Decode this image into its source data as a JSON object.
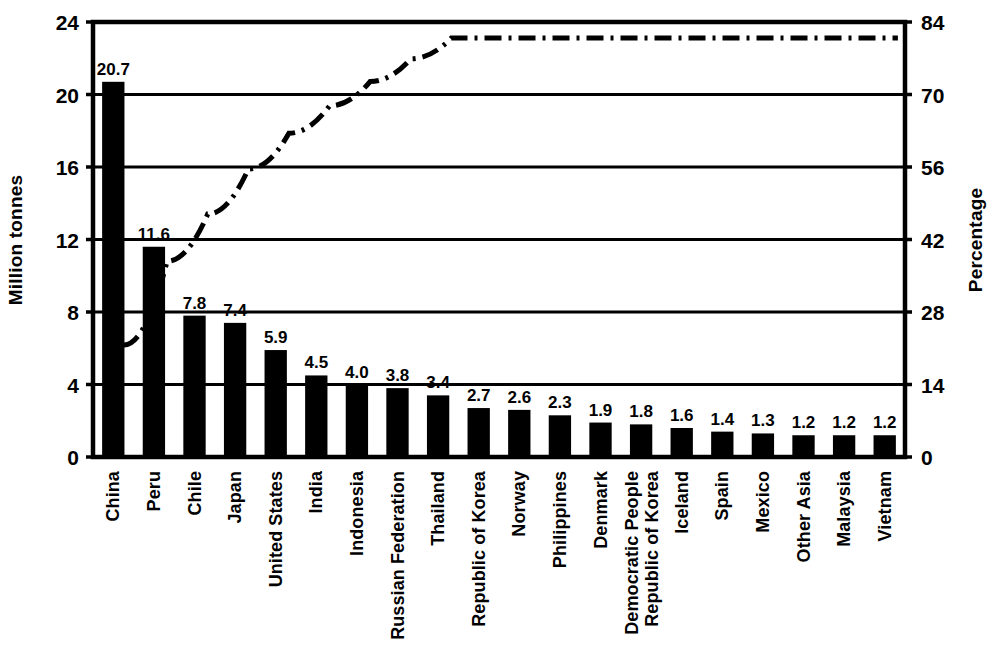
{
  "chart_data": {
    "type": "bar",
    "title": "",
    "subtitle": "",
    "xlabel": "",
    "ylabel": "Million tonnes",
    "y2label": "Percentage",
    "grid": true,
    "legend": "none",
    "ylim": [
      0,
      24
    ],
    "y2lim": [
      0,
      84
    ],
    "yticks": [
      "0",
      "4",
      "8",
      "12",
      "16",
      "20",
      "24"
    ],
    "y2ticks": [
      "0",
      "14",
      "28",
      "42",
      "56",
      "70",
      "84"
    ],
    "categories": [
      "China",
      "Peru",
      "Chile",
      "Japan",
      "United States",
      "India",
      "Indonesia",
      "Russian Federation",
      "Thailand",
      "Republic of Korea",
      "Norway",
      "Philippines",
      "Denmark",
      "Democratic People\nRepublic of Korea",
      "Iceland",
      "Spain",
      "Mexico",
      "Other Asia",
      "Malaysia",
      "Vietnam"
    ],
    "values": [
      20.7,
      11.6,
      7.8,
      7.4,
      5.9,
      4.5,
      4.0,
      3.8,
      3.4,
      2.7,
      2.6,
      2.3,
      1.9,
      1.8,
      1.6,
      1.4,
      1.3,
      1.2,
      1.2,
      1.2
    ],
    "value_labels": [
      "20.7",
      "11.6",
      "7.8",
      "7.4",
      "5.9",
      "4.5",
      "4.0",
      "3.8",
      "3.4",
      "2.7",
      "2.6",
      "2.3",
      "1.9",
      "1.8",
      "1.6",
      "1.4",
      "1.3",
      "1.2",
      "1.2",
      "1.2"
    ],
    "series": [
      {
        "name": "Million tonnes",
        "type": "bar",
        "axis": "left",
        "color": "#000000",
        "values": [
          20.7,
          11.6,
          7.8,
          7.4,
          5.9,
          4.5,
          4.0,
          3.8,
          3.4,
          2.7,
          2.6,
          2.3,
          1.9,
          1.8,
          1.6,
          1.4,
          1.3,
          1.2,
          1.2,
          1.2
        ]
      },
      {
        "name": "Cumulative percentage",
        "type": "line",
        "style": "dash-dot",
        "axis": "right",
        "color": "#000000",
        "values": [
          24.2,
          37.8,
          46.9,
          55.6,
          62.5,
          67.8,
          72.5,
          76.9,
          80.9,
          84.1,
          87.1,
          89.8,
          92.0,
          94.1,
          96.0,
          97.7,
          99.2,
          100.6,
          102.0,
          103.4
        ]
      }
    ]
  },
  "axes": {
    "left_title": "Million tonnes",
    "right_title": "Percentage"
  }
}
